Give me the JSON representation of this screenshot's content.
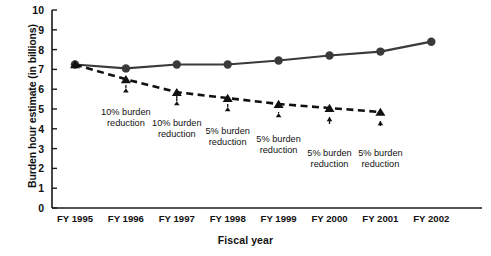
{
  "chart_data": {
    "type": "line",
    "title": "",
    "xlabel": "Fiscal year",
    "ylabel": "Burden hour estimate (in billions)",
    "categories": [
      "FY 1995",
      "FY 1996",
      "FY 1997",
      "FY 1998",
      "FY 1999",
      "FY 2000",
      "FY 2001",
      "FY 2002"
    ],
    "ylim": [
      0,
      10
    ],
    "yticks": [
      "0",
      "1",
      "2",
      "3",
      "4",
      "5",
      "6",
      "7",
      "8",
      "9",
      "10"
    ],
    "grid": false,
    "legend": "none",
    "series": [
      {
        "name": "Actual burden hour estimate",
        "style": "solid",
        "marker": "circle",
        "color": "#3a3a3a",
        "values": [
          7.25,
          7.05,
          7.25,
          7.25,
          7.45,
          7.7,
          7.9,
          8.4
        ]
      },
      {
        "name": "Projected burden hours with reductions",
        "style": "dashed",
        "marker": "triangle",
        "color": "#111111",
        "values": [
          7.25,
          6.5,
          5.85,
          5.55,
          5.25,
          5.05,
          4.85,
          null
        ]
      }
    ],
    "annotations": [
      {
        "label": "10% burden\nreduction",
        "line1": "10% burden",
        "line2": "reduction",
        "at_category": "FY 1996"
      },
      {
        "label": "10% burden\nreduction",
        "line1": "10% burden",
        "line2": "reduction",
        "at_category": "FY 1997"
      },
      {
        "label": "5% burden\nreduction",
        "line1": "5% burden",
        "line2": "reduction",
        "at_category": "FY 1998"
      },
      {
        "label": "5% burden\nreduction",
        "line1": "5% burden",
        "line2": "reduction",
        "at_category": "FY 1999"
      },
      {
        "label": "5% burden\nreduction",
        "line1": "5% burden",
        "line2": "reduction",
        "at_category": "FY 2000"
      },
      {
        "label": "5% burden\nreduction",
        "line1": "5% burden",
        "line2": "reduction",
        "at_category": "FY 2001"
      }
    ]
  }
}
